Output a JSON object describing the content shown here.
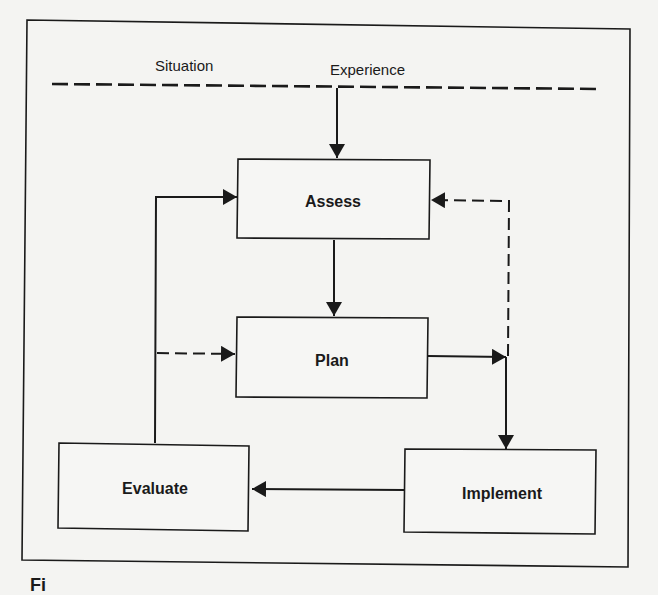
{
  "diagram": {
    "type": "flow-cycle",
    "top_labels": {
      "left": "Situation",
      "right": "Experience"
    },
    "nodes": [
      {
        "id": "assess",
        "label": "Assess"
      },
      {
        "id": "plan",
        "label": "Plan"
      },
      {
        "id": "implement",
        "label": "Implement"
      },
      {
        "id": "evaluate",
        "label": "Evaluate"
      }
    ],
    "edges": [
      {
        "from": "situation-experience-line",
        "to": "assess",
        "style": "solid"
      },
      {
        "from": "assess",
        "to": "plan",
        "style": "solid"
      },
      {
        "from": "plan",
        "to": "implement",
        "style": "solid"
      },
      {
        "from": "implement",
        "to": "evaluate",
        "style": "solid"
      },
      {
        "from": "evaluate",
        "to": "assess",
        "style": "solid"
      },
      {
        "from": "evaluate",
        "to": "plan",
        "style": "dashed"
      },
      {
        "from": "plan-implement-junction",
        "to": "assess",
        "style": "dashed"
      }
    ],
    "colors": {
      "line": "#1a1a1a",
      "background": "#f4f4f2"
    },
    "caption_fragment": "Fi"
  }
}
